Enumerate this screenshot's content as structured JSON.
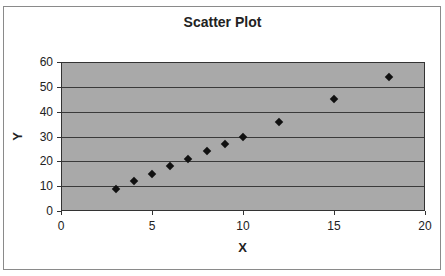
{
  "chart_data": {
    "type": "scatter",
    "title": "Scatter Plot",
    "xlabel": "X",
    "ylabel": "Y",
    "xlim": [
      0,
      20
    ],
    "ylim": [
      0,
      60
    ],
    "x_ticks": [
      0,
      5,
      10,
      15,
      20
    ],
    "y_ticks": [
      0,
      10,
      20,
      30,
      40,
      50,
      60
    ],
    "grid": {
      "horizontal": true,
      "vertical": false
    },
    "legend": null,
    "marker": "diamond",
    "colors": {
      "plot_background": "#a9a9a9",
      "marker": "#111111",
      "gridline": "#3a3a3a",
      "frame": "#8a8a8a"
    },
    "series": [
      {
        "name": "Series 1",
        "x": [
          3,
          4,
          5,
          6,
          7,
          8,
          9,
          10,
          12,
          15,
          18
        ],
        "y": [
          9,
          12,
          15,
          18,
          21,
          24,
          27,
          30,
          36,
          45,
          54
        ]
      }
    ]
  }
}
